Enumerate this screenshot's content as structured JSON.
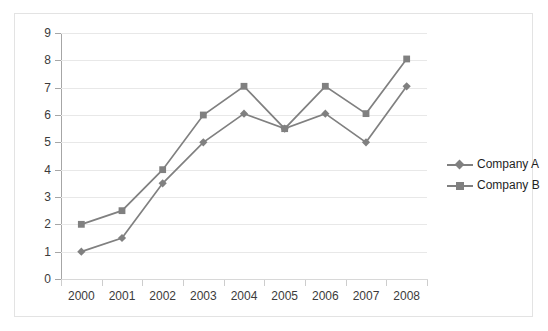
{
  "figure": {
    "clipped_text_above": "",
    "frame_border_color": "#e3e3e3",
    "plot_background": "#ffffff",
    "gridline_color": "#e8e8e8",
    "axis_color": "#a6a6a6",
    "series_color": "#808080",
    "label_color": "#3b3b3b"
  },
  "legend": {
    "position": "right",
    "entries": [
      {
        "label": "Company A",
        "marker": "diamond-marker",
        "color": "#808080"
      },
      {
        "label": "Company B",
        "marker": "square-marker",
        "color": "#808080"
      }
    ]
  },
  "chart_data": {
    "type": "line",
    "title": "",
    "subtitle": "",
    "xlabel": "",
    "ylabel": "",
    "x": [
      "2000",
      "2001",
      "2002",
      "2003",
      "2004",
      "2005",
      "2006",
      "2007",
      "2008"
    ],
    "categories": [
      "2000",
      "2001",
      "2002",
      "2003",
      "2004",
      "2005",
      "2006",
      "2007",
      "2008"
    ],
    "series": [
      {
        "name": "Company A",
        "marker": "diamond",
        "color": "#808080",
        "values": [
          1,
          1.5,
          3.5,
          5,
          6.05,
          5.5,
          6.05,
          5,
          7.05
        ]
      },
      {
        "name": "Company B",
        "marker": "square",
        "color": "#808080",
        "values": [
          2,
          2.5,
          4,
          6,
          7.05,
          5.5,
          7.05,
          6.05,
          8.05
        ]
      }
    ],
    "ylim": [
      0,
      9
    ],
    "yticks": [
      0,
      1,
      2,
      3,
      4,
      5,
      6,
      7,
      8,
      9
    ],
    "ytick_labels": [
      "0",
      "1",
      "2",
      "3",
      "4",
      "5",
      "6",
      "7",
      "8",
      "9"
    ],
    "xtick_labels": [
      "2000",
      "2001",
      "2002",
      "2003",
      "2004",
      "2005",
      "2006",
      "2007",
      "2008"
    ],
    "grid": "horizontal",
    "legend_position": "right"
  }
}
